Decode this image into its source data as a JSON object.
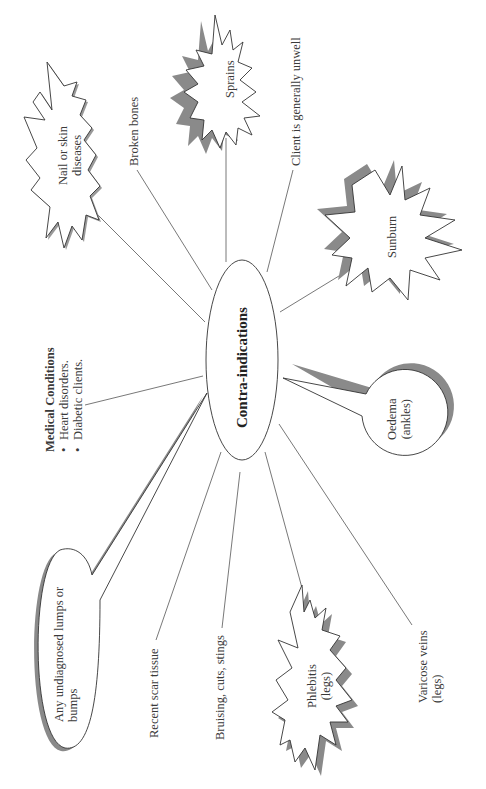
{
  "center": {
    "label": "Contra-indications"
  },
  "nodes": {
    "nail_skin": {
      "line1": "Nail or skin",
      "line2": "diseases",
      "shape": "starburst"
    },
    "broken_bones": {
      "label": "Broken bones",
      "shape": "text"
    },
    "sprains": {
      "label": "Sprains",
      "shape": "starburst"
    },
    "unwell": {
      "label": "Client is generally unwell",
      "shape": "text"
    },
    "sunburn": {
      "label": "Sunburn",
      "shape": "starburst"
    },
    "oedema": {
      "line1": "Oedema",
      "line2": "(ankles)",
      "shape": "speech-bubble"
    },
    "varicose": {
      "line1": "Varicose veins",
      "line2": "(legs)",
      "shape": "text"
    },
    "phlebitis": {
      "line1": "Phlebitis",
      "line2": "(legs)",
      "shape": "starburst"
    },
    "bruising": {
      "label": "Bruising, cuts, stings",
      "shape": "text"
    },
    "scar": {
      "label": "Recent scar tissue",
      "shape": "text"
    },
    "lumps": {
      "line1": "Any undiagnosed lumps or",
      "line2": "bumps",
      "shape": "speech-bubble"
    },
    "medical": {
      "title": "Medical Conditions",
      "items": [
        "Heart disorders.",
        "Diabetic clients."
      ]
    }
  },
  "colors": {
    "stroke": "#333333",
    "shadow": "#8a8a8a",
    "line": "#555555",
    "background": "#ffffff"
  }
}
